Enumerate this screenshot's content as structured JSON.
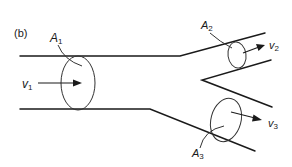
{
  "figure": {
    "panel_label": "(b)",
    "line_color": "#1a1a1a",
    "background": "#ffffff"
  },
  "labels": {
    "A1": {
      "base": "A",
      "sub": "1"
    },
    "A2": {
      "base": "A",
      "sub": "2"
    },
    "A3": {
      "base": "A",
      "sub": "3"
    },
    "v1": {
      "base": "v",
      "sub": "1"
    },
    "v2": {
      "base": "v",
      "sub": "2"
    },
    "v3": {
      "base": "v",
      "sub": "3"
    }
  }
}
